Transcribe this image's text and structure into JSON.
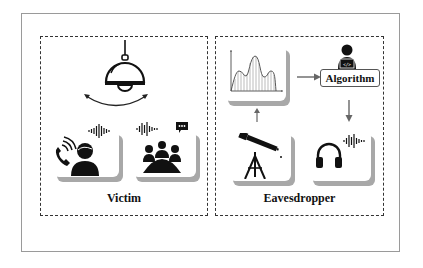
{
  "figure": {
    "panels": [
      {
        "id": "victim",
        "label": "Victim",
        "elements": [
          {
            "icon": "hanging-lamp-icon",
            "caption": ""
          },
          {
            "icon": "swing-arrow-icon"
          },
          {
            "icon": "phone-call-person-icon",
            "with": "sound-wave-icon"
          },
          {
            "icon": "meeting-group-icon",
            "with": [
              "sound-wave-icon",
              "chat-bubble-icon"
            ]
          }
        ]
      },
      {
        "id": "eavesdropper",
        "label": "Eavesdropper",
        "elements": [
          {
            "icon": "signal-waveform-chart-icon"
          },
          {
            "icon": "developer-laptop-icon"
          },
          {
            "icon": "telescope-icon"
          },
          {
            "icon": "headphones-icon",
            "with": "sound-wave-icon"
          }
        ],
        "algorithm_label": "Algorithm",
        "laptop_code_glyph": "</>"
      }
    ],
    "flow": [
      {
        "from": "telescope",
        "to": "waveform-chart"
      },
      {
        "from": "waveform-chart",
        "to": "algorithm"
      },
      {
        "from": "algorithm",
        "to": "headphones"
      }
    ]
  }
}
